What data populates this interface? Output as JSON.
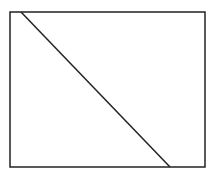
{
  "diagram": {
    "background": "#ffffff",
    "stroke_color": "#222222",
    "rectangle": {
      "x": 10,
      "y": 12,
      "width": 195,
      "height": 155
    },
    "diagonal_line": {
      "x1": 21,
      "y1": 12,
      "x2": 170,
      "y2": 167
    }
  }
}
